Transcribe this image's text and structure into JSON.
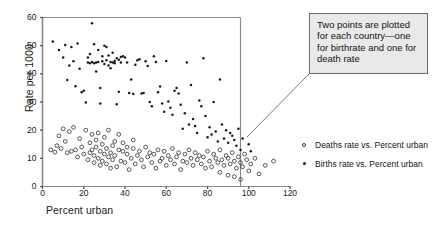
{
  "chart_data": {
    "type": "scatter",
    "title": "",
    "xlabel": "Percent urban",
    "ylabel": "Rate per 1000",
    "xlim": [
      0,
      120
    ],
    "ylim": [
      0,
      60
    ],
    "xticks": [
      0,
      20,
      40,
      60,
      80,
      100,
      120
    ],
    "yticks": [
      0,
      10,
      20,
      30,
      40,
      50,
      60
    ],
    "grid": false,
    "legend_position": "right",
    "annotation": "Two points are plotted for each country—one for birthrate and one for death rate",
    "series": [
      {
        "name": "Births rate vs. Percent urban",
        "marker": "filled-dot",
        "color": "#1a1a1a",
        "points": [
          [
            5,
            51.5
          ],
          [
            8,
            48.5
          ],
          [
            10,
            45.8
          ],
          [
            11,
            50.2
          ],
          [
            12,
            37.8
          ],
          [
            13,
            43.0
          ],
          [
            14,
            49.5
          ],
          [
            15,
            44.5
          ],
          [
            16,
            35.6
          ],
          [
            17,
            50.8
          ],
          [
            18,
            41.8
          ],
          [
            19,
            33.5
          ],
          [
            20,
            34.0
          ],
          [
            21,
            29.8
          ],
          [
            22,
            44.0
          ],
          [
            22,
            45.8
          ],
          [
            23,
            43.8
          ],
          [
            23,
            47.0
          ],
          [
            24,
            58.0
          ],
          [
            24,
            44.2
          ],
          [
            25,
            43.8
          ],
          [
            25,
            50.5
          ],
          [
            26,
            44.0
          ],
          [
            26,
            40.8
          ],
          [
            27,
            48.5
          ],
          [
            27,
            44.2
          ],
          [
            28,
            35.0
          ],
          [
            28,
            29.5
          ],
          [
            29,
            46.2
          ],
          [
            29,
            44.5
          ],
          [
            30,
            43.5
          ],
          [
            30,
            50.0
          ],
          [
            31,
            44.8
          ],
          [
            31,
            49.5
          ],
          [
            32,
            43.0
          ],
          [
            32,
            46.5
          ],
          [
            33,
            44.2
          ],
          [
            33,
            42.0
          ],
          [
            34,
            44.0
          ],
          [
            34,
            47.5
          ],
          [
            35,
            43.8
          ],
          [
            35,
            44.6
          ],
          [
            36,
            45.5
          ],
          [
            36,
            29.2
          ],
          [
            37,
            45.0
          ],
          [
            37,
            33.6
          ],
          [
            38,
            46.0
          ],
          [
            38,
            44.0
          ],
          [
            39,
            46.2
          ],
          [
            40,
            45.8
          ],
          [
            41,
            44.0
          ],
          [
            42,
            33.2
          ],
          [
            43,
            38.0
          ],
          [
            44,
            32.8
          ],
          [
            45,
            43.2
          ],
          [
            46,
            44.8
          ],
          [
            47,
            45.2
          ],
          [
            48,
            33.0
          ],
          [
            49,
            33.2
          ],
          [
            50,
            44.5
          ],
          [
            51,
            42.8
          ],
          [
            52,
            30.0
          ],
          [
            53,
            28.5
          ],
          [
            54,
            46.2
          ],
          [
            55,
            44.2
          ],
          [
            56,
            33.5
          ],
          [
            57,
            35.5
          ],
          [
            58,
            29.5
          ],
          [
            59,
            26.5
          ],
          [
            60,
            44.6
          ],
          [
            61,
            30.2
          ],
          [
            62,
            28.0
          ],
          [
            63,
            25.5
          ],
          [
            64,
            34.0
          ],
          [
            65,
            35.0
          ],
          [
            66,
            33.0
          ],
          [
            67,
            29.0
          ],
          [
            68,
            20.5
          ],
          [
            69,
            26.0
          ],
          [
            70,
            44.0
          ],
          [
            71,
            22.0
          ],
          [
            72,
            36.0
          ],
          [
            73,
            24.0
          ],
          [
            74,
            21.5
          ],
          [
            75,
            19.0
          ],
          [
            76,
            30.5
          ],
          [
            77,
            28.5
          ],
          [
            78,
            45.5
          ],
          [
            79,
            25.0
          ],
          [
            80,
            17.5
          ],
          [
            81,
            21.0
          ],
          [
            82,
            18.5
          ],
          [
            83,
            30.0
          ],
          [
            84,
            19.5
          ],
          [
            85,
            16.0
          ],
          [
            86,
            38.0
          ],
          [
            87,
            22.0
          ],
          [
            88,
            17.0
          ],
          [
            89,
            20.0
          ],
          [
            90,
            15.5
          ],
          [
            91,
            19.0
          ],
          [
            92,
            18.0
          ],
          [
            93,
            16.5
          ],
          [
            94,
            14.5
          ],
          [
            95,
            20.5
          ],
          [
            96,
            13.0
          ],
          [
            97,
            17.0
          ],
          [
            100,
            15.0
          ],
          [
            101,
            12.5
          ]
        ]
      },
      {
        "name": "Deaths rate vs. Percent urban",
        "marker": "open-circle",
        "color": "#3a3a3a",
        "points": [
          [
            4,
            13.0
          ],
          [
            6,
            12.2
          ],
          [
            7,
            14.5
          ],
          [
            8,
            18.0
          ],
          [
            9,
            13.5
          ],
          [
            10,
            20.5
          ],
          [
            11,
            16.0
          ],
          [
            12,
            12.0
          ],
          [
            13,
            19.5
          ],
          [
            14,
            12.5
          ],
          [
            15,
            21.0
          ],
          [
            16,
            13.0
          ],
          [
            17,
            10.5
          ],
          [
            18,
            17.0
          ],
          [
            19,
            14.0
          ],
          [
            20,
            11.5
          ],
          [
            21,
            20.0
          ],
          [
            22,
            9.5
          ],
          [
            23,
            15.5
          ],
          [
            23,
            12.0
          ],
          [
            24,
            18.5
          ],
          [
            24,
            13.0
          ],
          [
            25,
            11.0
          ],
          [
            25,
            8.5
          ],
          [
            26,
            16.5
          ],
          [
            26,
            14.0
          ],
          [
            27,
            19.0
          ],
          [
            27,
            10.0
          ],
          [
            28,
            12.5
          ],
          [
            28,
            7.5
          ],
          [
            29,
            15.0
          ],
          [
            29,
            9.0
          ],
          [
            30,
            17.5
          ],
          [
            30,
            11.5
          ],
          [
            31,
            13.5
          ],
          [
            31,
            8.0
          ],
          [
            32,
            20.0
          ],
          [
            32,
            10.5
          ],
          [
            33,
            12.0
          ],
          [
            33,
            6.5
          ],
          [
            34,
            14.5
          ],
          [
            34,
            9.5
          ],
          [
            35,
            16.0
          ],
          [
            35,
            11.0
          ],
          [
            36,
            7.0
          ],
          [
            37,
            13.0
          ],
          [
            37,
            18.5
          ],
          [
            38,
            9.0
          ],
          [
            39,
            12.5
          ],
          [
            39,
            15.5
          ],
          [
            40,
            8.5
          ],
          [
            41,
            11.5
          ],
          [
            41,
            14.0
          ],
          [
            42,
            6.0
          ],
          [
            43,
            10.0
          ],
          [
            44,
            13.5
          ],
          [
            44,
            16.5
          ],
          [
            45,
            8.0
          ],
          [
            46,
            11.0
          ],
          [
            47,
            12.5
          ],
          [
            48,
            9.5
          ],
          [
            49,
            7.0
          ],
          [
            50,
            14.0
          ],
          [
            51,
            10.5
          ],
          [
            52,
            12.0
          ],
          [
            53,
            8.5
          ],
          [
            54,
            11.5
          ],
          [
            55,
            6.5
          ],
          [
            56,
            13.0
          ],
          [
            57,
            9.0
          ],
          [
            58,
            10.0
          ],
          [
            59,
            12.5
          ],
          [
            60,
            7.5
          ],
          [
            61,
            11.0
          ],
          [
            62,
            9.5
          ],
          [
            63,
            13.5
          ],
          [
            64,
            8.0
          ],
          [
            65,
            10.5
          ],
          [
            66,
            12.0
          ],
          [
            67,
            6.0
          ],
          [
            68,
            9.0
          ],
          [
            69,
            11.5
          ],
          [
            70,
            8.5
          ],
          [
            71,
            13.0
          ],
          [
            72,
            10.0
          ],
          [
            73,
            7.5
          ],
          [
            74,
            12.0
          ],
          [
            75,
            9.5
          ],
          [
            76,
            11.0
          ],
          [
            77,
            8.0
          ],
          [
            78,
            10.5
          ],
          [
            79,
            6.5
          ],
          [
            80,
            12.5
          ],
          [
            81,
            9.0
          ],
          [
            82,
            7.0
          ],
          [
            83,
            11.5
          ],
          [
            84,
            10.0
          ],
          [
            85,
            8.5
          ],
          [
            86,
            13.0
          ],
          [
            87,
            9.5
          ],
          [
            88,
            7.5
          ],
          [
            89,
            11.0
          ],
          [
            90,
            10.0
          ],
          [
            91,
            8.0
          ],
          [
            92,
            12.0
          ],
          [
            93,
            9.0
          ],
          [
            94,
            6.5
          ],
          [
            95,
            10.5
          ],
          [
            96,
            8.5
          ],
          [
            97,
            7.0
          ],
          [
            98,
            11.5
          ],
          [
            99,
            9.5
          ],
          [
            100,
            5.5
          ],
          [
            101,
            8.0
          ],
          [
            103,
            10.0
          ],
          [
            105,
            4.5
          ],
          [
            108,
            7.5
          ],
          [
            112,
            9.0
          ],
          [
            86,
            5.0
          ],
          [
            90,
            4.0
          ],
          [
            93,
            3.5
          ],
          [
            96,
            2.5
          ]
        ]
      }
    ]
  },
  "axis": {
    "ylabel": "Rate per 1000",
    "xlabel": "Percent urban",
    "yticks": [
      "0",
      "10",
      "20",
      "30",
      "40",
      "50",
      "60"
    ],
    "xticks": [
      "0",
      "20",
      "40",
      "60",
      "80",
      "100",
      "120"
    ]
  },
  "callout": {
    "text": "Two points are plotted for each country—one for birthrate and one for death rate"
  },
  "legend": {
    "entries": [
      {
        "label": "Deaths rate vs. Percent urban",
        "marker": "open-circle"
      },
      {
        "label": "Births rate vs. Percent urban",
        "marker": "filled-dot"
      }
    ]
  }
}
